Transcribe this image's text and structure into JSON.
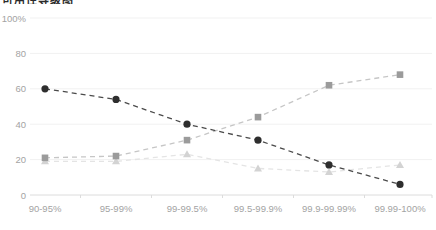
{
  "page": {
    "background": "#ffffff",
    "title_clipped": "可用性等级图"
  },
  "chart_data": {
    "type": "line",
    "title": "",
    "xlabel": "",
    "ylabel": "",
    "categories": [
      "90-95%",
      "95-99%",
      "99-99.5%",
      "99.5-99.9%",
      "99.9-99.99%",
      "99.99-100%"
    ],
    "y_ticks": [
      {
        "value": 0,
        "label": "0"
      },
      {
        "value": 20,
        "label": "20"
      },
      {
        "value": 40,
        "label": "40"
      },
      {
        "value": 60,
        "label": "60"
      },
      {
        "value": 80,
        "label": "80"
      },
      {
        "value": 100,
        "label": "100%"
      }
    ],
    "ylim": [
      0,
      100
    ],
    "grid": true,
    "legend_position": "none",
    "line_style": "dashed",
    "series": [
      {
        "name": "triangle-series",
        "marker": "triangle",
        "line_color": "#e4e4e4",
        "marker_color": "#d3d3d3",
        "values": [
          19,
          19,
          23,
          15,
          13,
          17
        ]
      },
      {
        "name": "square-series",
        "marker": "square",
        "line_color": "#c6c6c6",
        "marker_color": "#9b9b9b",
        "values": [
          21,
          22,
          31,
          44,
          62,
          68
        ]
      },
      {
        "name": "circle-series",
        "marker": "circle",
        "line_color": "#4a4a4a",
        "marker_color": "#2e2e2e",
        "values": [
          60,
          54,
          40,
          31,
          17,
          6
        ]
      }
    ],
    "colors": {
      "grid_line": "#f1f1f1",
      "axis_line": "#dcdcdc",
      "tick_label": "#a3a3a3"
    }
  }
}
